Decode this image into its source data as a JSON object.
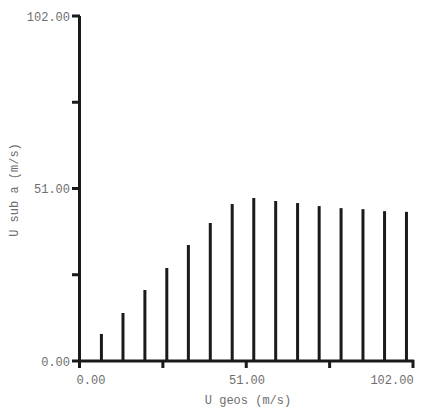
{
  "chart_data": {
    "type": "bar",
    "style": "vertical-lines",
    "title": "",
    "xlabel": "U geos (m/s)",
    "ylabel": "U sub a (m/s)",
    "xlim": [
      0,
      102
    ],
    "ylim": [
      0,
      102
    ],
    "grid": false,
    "legend": null,
    "x_ticks": [
      0,
      25.5,
      51,
      76.5,
      102
    ],
    "x_tick_labels": [
      "0.00",
      "",
      "51.00",
      "",
      "102.00"
    ],
    "y_ticks": [
      0,
      25.5,
      51,
      76.5,
      102
    ],
    "y_tick_labels": [
      "0.00",
      "",
      "51.00",
      "",
      "102.00"
    ],
    "x": [
      6.7,
      13.3,
      20.0,
      26.7,
      33.3,
      40.0,
      46.7,
      53.3,
      60.0,
      66.7,
      73.3,
      80.0,
      86.7,
      93.3,
      100.0
    ],
    "values": [
      8.0,
      14.2,
      21.0,
      27.5,
      34.3,
      40.8,
      46.4,
      48.2,
      47.3,
      46.7,
      45.8,
      45.2,
      44.9,
      44.3,
      44.1
    ],
    "colors": {
      "line": "#1a1a1a",
      "text": "#6e6e6e",
      "background": "#ffffff"
    }
  },
  "labels": {
    "x_axis": "U geos (m/s)",
    "y_axis": "U sub a (m/s)",
    "x_tick_0": "0.00",
    "x_tick_mid": "51.00",
    "x_tick_max": "102.00",
    "y_tick_0": "0.00",
    "y_tick_mid": "51.00",
    "y_tick_max": "102.00"
  }
}
